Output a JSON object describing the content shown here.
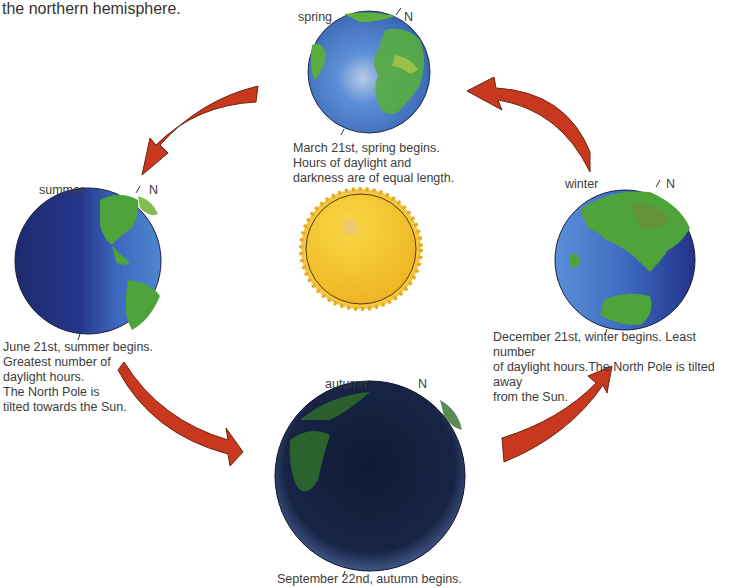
{
  "intro_text": "the northern hemisphere.",
  "north_label": "N",
  "sun": {
    "label": "Sun"
  },
  "seasons": {
    "spring": {
      "label": "spring",
      "caption": "March 21st, spring begins.\nHours of daylight and\ndarkness are of equal length."
    },
    "summer": {
      "label": "summer",
      "caption": "June 21st, summer begins.\nGreatest number of\ndaylight hours.\nThe North Pole is\ntilted towards the Sun."
    },
    "autumn": {
      "label": "autumn",
      "caption": "September 22nd, autumn begins."
    },
    "winter": {
      "label": "winter",
      "caption": "December 21st, winter begins. Least number\nof daylight hours.The North Pole is tilted away\nfrom the Sun."
    }
  },
  "colors": {
    "arrow": "#c8381e",
    "arrow_outline": "#6a2414",
    "ocean": "#3d6fc0",
    "land": "#4fa83a",
    "sun": "#f5c431"
  }
}
